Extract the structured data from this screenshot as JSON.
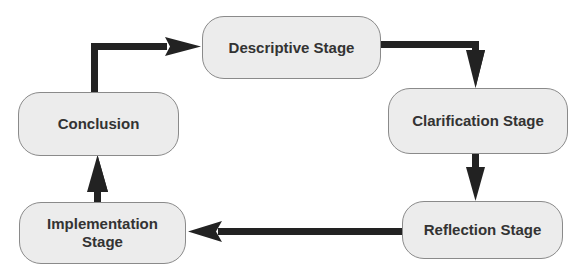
{
  "diagram": {
    "type": "cycle-flowchart",
    "colors": {
      "node_fill": "#ececec",
      "node_border": "#8a8a8a",
      "text": "#333333",
      "arrow": "#222222",
      "background": "#ffffff"
    },
    "nodes": [
      {
        "id": "descriptive",
        "label": "Descriptive Stage"
      },
      {
        "id": "clarification",
        "label": "Clarification Stage"
      },
      {
        "id": "reflection",
        "label": "Reflection Stage"
      },
      {
        "id": "implementation",
        "label": "Implementation Stage",
        "label_line1": "Implementation",
        "label_line2": "Stage"
      },
      {
        "id": "conclusion",
        "label": "Conclusion"
      }
    ],
    "edges": [
      {
        "from": "descriptive",
        "to": "clarification"
      },
      {
        "from": "clarification",
        "to": "reflection"
      },
      {
        "from": "reflection",
        "to": "implementation"
      },
      {
        "from": "implementation",
        "to": "conclusion"
      },
      {
        "from": "conclusion",
        "to": "descriptive"
      }
    ]
  }
}
